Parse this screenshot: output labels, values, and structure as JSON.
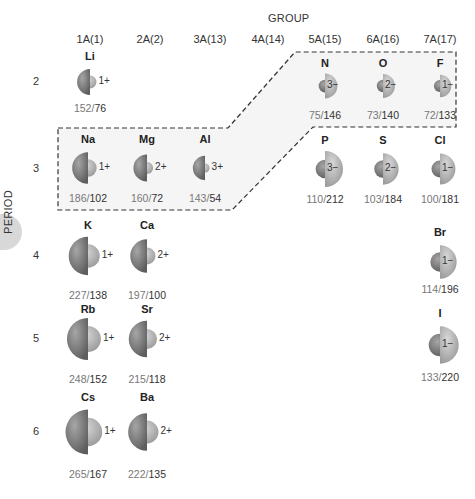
{
  "header": {
    "group_title": "GROUP",
    "period_title": "PERIOD"
  },
  "columns": [
    {
      "label": "1A(1)",
      "x": 90
    },
    {
      "label": "2A(2)",
      "x": 150
    },
    {
      "label": "3A(13)",
      "x": 210
    },
    {
      "label": "4A(14)",
      "x": 268
    },
    {
      "label": "5A(15)",
      "x": 325
    },
    {
      "label": "6A(16)",
      "x": 383
    },
    {
      "label": "7A(17)",
      "x": 440
    }
  ],
  "rows": [
    {
      "label": "2",
      "y": 82
    },
    {
      "label": "3",
      "y": 169
    },
    {
      "label": "4",
      "y": 256
    },
    {
      "label": "5",
      "y": 339
    },
    {
      "label": "6",
      "y": 432
    }
  ],
  "colors": {
    "atom_dark": "#5e5e5e",
    "atom_light": "#a6a6a6",
    "ion_light": "#d8d8d8",
    "ion_dark": "#9a9a9a",
    "outline_dash": "#333333",
    "highlight_fill": "#f4f4f4"
  },
  "elements": [
    {
      "symbol": "Li",
      "atomic_radius": "152",
      "ionic_radius": "76",
      "charge": "1+",
      "type": "cation",
      "cx": 90,
      "cy": 82,
      "labelY": 50,
      "radiiY": 102
    },
    {
      "symbol": "N",
      "atomic_radius": "75",
      "ionic_radius": "146",
      "charge": "3−",
      "type": "anion",
      "cx": 325,
      "cy": 86,
      "labelY": 57,
      "radiiY": 109
    },
    {
      "symbol": "O",
      "atomic_radius": "73",
      "ionic_radius": "140",
      "charge": "2−",
      "type": "anion",
      "cx": 383,
      "cy": 86,
      "labelY": 57,
      "radiiY": 109
    },
    {
      "symbol": "F",
      "atomic_radius": "72",
      "ionic_radius": "133",
      "charge": "1−",
      "type": "anion",
      "cx": 440,
      "cy": 86,
      "labelY": 57,
      "radiiY": 109
    },
    {
      "symbol": "Na",
      "atomic_radius": "186",
      "ionic_radius": "102",
      "charge": "1+",
      "type": "cation",
      "cx": 88,
      "cy": 168,
      "labelY": 133,
      "radiiY": 192
    },
    {
      "symbol": "Mg",
      "atomic_radius": "160",
      "ionic_radius": "72",
      "charge": "2+",
      "type": "cation",
      "cx": 147,
      "cy": 168,
      "labelY": 133,
      "radiiY": 192
    },
    {
      "symbol": "Al",
      "atomic_radius": "143",
      "ionic_radius": "54",
      "charge": "3+",
      "type": "cation",
      "cx": 205,
      "cy": 168,
      "labelY": 133,
      "radiiY": 192
    },
    {
      "symbol": "P",
      "atomic_radius": "110",
      "ionic_radius": "212",
      "charge": "3−",
      "type": "anion",
      "cx": 325,
      "cy": 169,
      "labelY": 134,
      "radiiY": 193
    },
    {
      "symbol": "S",
      "atomic_radius": "103",
      "ionic_radius": "184",
      "charge": "2−",
      "type": "anion",
      "cx": 383,
      "cy": 169,
      "labelY": 134,
      "radiiY": 193
    },
    {
      "symbol": "Cl",
      "atomic_radius": "100",
      "ionic_radius": "181",
      "charge": "1−",
      "type": "anion",
      "cx": 440,
      "cy": 169,
      "labelY": 134,
      "radiiY": 193
    },
    {
      "symbol": "K",
      "atomic_radius": "227",
      "ionic_radius": "138",
      "charge": "1+",
      "type": "cation",
      "cx": 88,
      "cy": 256,
      "labelY": 219,
      "radiiY": 289
    },
    {
      "symbol": "Ca",
      "atomic_radius": "197",
      "ionic_radius": "100",
      "charge": "2+",
      "type": "cation",
      "cx": 147,
      "cy": 256,
      "labelY": 219,
      "radiiY": 289
    },
    {
      "symbol": "Br",
      "atomic_radius": "114",
      "ionic_radius": "196",
      "charge": "1−",
      "type": "anion",
      "cx": 440,
      "cy": 262,
      "labelY": 226,
      "radiiY": 283
    },
    {
      "symbol": "Rb",
      "atomic_radius": "248",
      "ionic_radius": "152",
      "charge": "1+",
      "type": "cation",
      "cx": 88,
      "cy": 339,
      "labelY": 303,
      "radiiY": 373
    },
    {
      "symbol": "Sr",
      "atomic_radius": "215",
      "ionic_radius": "118",
      "charge": "2+",
      "type": "cation",
      "cx": 147,
      "cy": 339,
      "labelY": 303,
      "radiiY": 373
    },
    {
      "symbol": "I",
      "atomic_radius": "133",
      "ionic_radius": "220",
      "charge": "1−",
      "type": "anion",
      "cx": 440,
      "cy": 345,
      "labelY": 307,
      "radiiY": 371
    },
    {
      "symbol": "Cs",
      "atomic_radius": "265",
      "ionic_radius": "167",
      "charge": "1+",
      "type": "cation",
      "cx": 88,
      "cy": 432,
      "labelY": 391,
      "radiiY": 468
    },
    {
      "symbol": "Ba",
      "atomic_radius": "222",
      "ionic_radius": "135",
      "charge": "2+",
      "type": "cation",
      "cx": 147,
      "cy": 432,
      "labelY": 391,
      "radiiY": 468
    }
  ]
}
